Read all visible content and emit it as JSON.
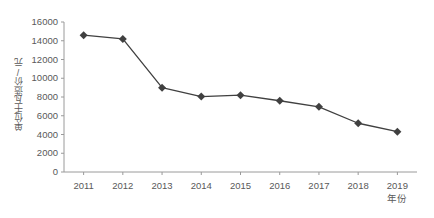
{
  "chart_data": {
    "type": "line",
    "title": "",
    "xlabel": "年份",
    "ylabel": "单位千瓦造价/元",
    "categories": [
      "2011",
      "2012",
      "2013",
      "2014",
      "2015",
      "2016",
      "2017",
      "2018",
      "2019"
    ],
    "values": [
      14600,
      14200,
      9000,
      8050,
      8200,
      7600,
      6950,
      5200,
      4300
    ],
    "series": [
      {
        "name": "单位千瓦造价",
        "values": [
          14600,
          14200,
          9000,
          8050,
          8200,
          7600,
          6950,
          5200,
          4300
        ]
      }
    ],
    "ylim": [
      0,
      16000
    ],
    "y_ticks": [
      "0",
      "2000",
      "4000",
      "6000",
      "8000",
      "10000",
      "12000",
      "14000",
      "16000"
    ],
    "y_tick_values": [
      0,
      2000,
      4000,
      6000,
      8000,
      10000,
      12000,
      14000,
      16000
    ],
    "grid": false,
    "legend": false,
    "legend_position": "none",
    "marker": "diamond",
    "colors": {
      "series_line": "#404040",
      "marker": "#404040",
      "axis": "#9a9a9a",
      "text": "#595959",
      "background": "#ffffff"
    }
  }
}
